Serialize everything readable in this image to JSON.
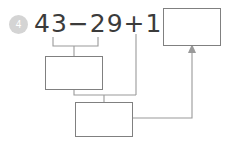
{
  "problem": {
    "number": "4",
    "equation": "43−29+19=",
    "operands": [
      43,
      29,
      19
    ],
    "operators": [
      "−",
      "+"
    ]
  },
  "boxes": {
    "final_answer": {
      "label": "final-answer-box",
      "value": "",
      "placeholder": ""
    },
    "subtraction_step": {
      "label": "subtraction-step-box",
      "value": "",
      "placeholder": ""
    },
    "total_step": {
      "label": "total-step-box",
      "value": "",
      "placeholder": ""
    }
  },
  "connectors": {
    "bracket_label": "bracket-under-43-minus-29",
    "arrow_label": "arrow-to-final-answer"
  },
  "colors": {
    "background": "#ffffff",
    "text": "#3b3b3b",
    "box_border": "#808080",
    "line": "#9a9a9a",
    "badge_fill": "#d4d4d4",
    "badge_text": "#ffffff"
  }
}
